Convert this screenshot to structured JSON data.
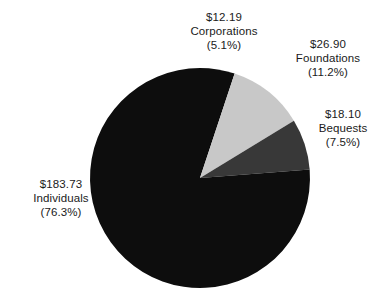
{
  "chart_data": {
    "type": "pie",
    "title": "",
    "subtitle": "",
    "xlabel": "",
    "ylabel": "",
    "legend_position": "none",
    "grid": false,
    "value_prefix": "$",
    "start_angle_deg": 0,
    "direction": "clockwise",
    "total_value": 240.92,
    "categories": [
      "Corporations",
      "Foundations",
      "Bequests",
      "Individuals"
    ],
    "values": [
      12.19,
      26.9,
      18.1,
      183.73
    ],
    "percentages": [
      5.1,
      11.2,
      7.5,
      76.3
    ],
    "colors": [
      "#0d0d0d",
      "#c8c8c8",
      "#383838",
      "#0d0d0d"
    ],
    "slices": [
      {
        "name": "Corporations",
        "value": 12.19,
        "percent": 5.1,
        "color": "#0d0d0d",
        "value_label": "$12.19",
        "name_label": "Corporations",
        "percent_label": "(5.1%)"
      },
      {
        "name": "Foundations",
        "value": 26.9,
        "percent": 11.2,
        "color": "#c8c8c8",
        "value_label": "$26.90",
        "name_label": "Foundations",
        "percent_label": "(11.2%)"
      },
      {
        "name": "Bequests",
        "value": 18.1,
        "percent": 7.5,
        "color": "#383838",
        "value_label": "$18.10",
        "name_label": "Bequests",
        "percent_label": "(7.5%)"
      },
      {
        "name": "Individuals",
        "value": 183.73,
        "percent": 76.3,
        "color": "#0d0d0d",
        "value_label": "$183.73",
        "name_label": "Individuals",
        "percent_label": "(76.3%)"
      }
    ]
  },
  "figure": {
    "background_color": "#ffffff",
    "text_color": "#1a1a1a",
    "center_x": 200,
    "center_y": 178,
    "radius": 110
  }
}
